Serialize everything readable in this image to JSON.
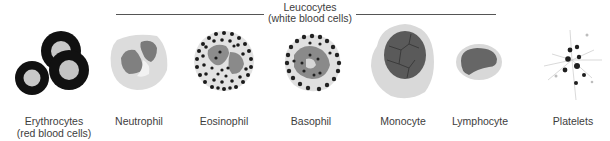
{
  "figure": {
    "group": {
      "title_line1": "Leucocytes",
      "title_line2": "(white blood cells)",
      "members": [
        "Neutrophil",
        "Eosinophil",
        "Basophil",
        "Monocyte",
        "Lymphocyte"
      ]
    },
    "cells": [
      {
        "id": "erythrocytes",
        "label_line1": "Erythrocytes",
        "label_line2": "(red blood cells)"
      },
      {
        "id": "neutrophil",
        "label_line1": "Neutrophil"
      },
      {
        "id": "eosinophil",
        "label_line1": "Eosinophil"
      },
      {
        "id": "basophil",
        "label_line1": "Basophil"
      },
      {
        "id": "monocyte",
        "label_line1": "Monocyte"
      },
      {
        "id": "lymphocyte",
        "label_line1": "Lymphocyte"
      },
      {
        "id": "platelets",
        "label_line1": "Platelets"
      }
    ],
    "colors": {
      "rbc_ring": "#111111",
      "rbc_center": "#c8c8c8",
      "cytoplasm": "#d9d9d9",
      "nucleus": "#7a7a7a",
      "granule": "#1a1a1a",
      "monocyte_nucleus": "#555555",
      "line": "#555555"
    }
  }
}
